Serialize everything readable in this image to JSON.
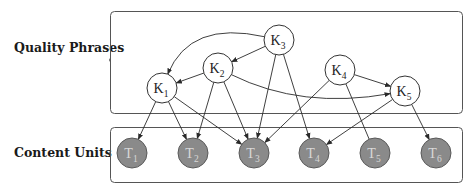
{
  "groups": {
    "quality_phrases": {
      "label": "Quality Phrases"
    },
    "content_units": {
      "label": "Content Units"
    }
  },
  "colors": {
    "edge": "#2a2a2a",
    "box_border": "#555555",
    "phrase_fill": "#ffffff",
    "unit_fill": "#8a8a8a",
    "unit_text": "#d8d8d8"
  },
  "phrases": [
    {
      "id": "K1",
      "base": "K",
      "sub": "1",
      "x": 162,
      "y": 88
    },
    {
      "id": "K2",
      "base": "K",
      "sub": "2",
      "x": 218,
      "y": 68
    },
    {
      "id": "K3",
      "base": "K",
      "sub": "3",
      "x": 279,
      "y": 40
    },
    {
      "id": "K4",
      "base": "K",
      "sub": "4",
      "x": 340,
      "y": 70
    },
    {
      "id": "K5",
      "base": "K",
      "sub": "5",
      "x": 405,
      "y": 91
    }
  ],
  "units": [
    {
      "id": "T1",
      "base": "T",
      "sub": "1",
      "x": 132,
      "y": 153
    },
    {
      "id": "T2",
      "base": "T",
      "sub": "2",
      "x": 193,
      "y": 153
    },
    {
      "id": "T3",
      "base": "T",
      "sub": "3",
      "x": 254,
      "y": 153
    },
    {
      "id": "T4",
      "base": "T",
      "sub": "4",
      "x": 314,
      "y": 153
    },
    {
      "id": "T5",
      "base": "T",
      "sub": "5",
      "x": 375,
      "y": 153
    },
    {
      "id": "T6",
      "base": "T",
      "sub": "6",
      "x": 436,
      "y": 153
    }
  ],
  "edges": [
    {
      "from": "K3",
      "to": "K1",
      "curved": true
    },
    {
      "from": "K3",
      "to": "K2"
    },
    {
      "from": "K2",
      "to": "K1"
    },
    {
      "from": "K2",
      "to": "K5",
      "curved": true
    },
    {
      "from": "K4",
      "to": "K5"
    },
    {
      "from": "K1",
      "to": "T1"
    },
    {
      "from": "K1",
      "to": "T2"
    },
    {
      "from": "K1",
      "to": "T3"
    },
    {
      "from": "K2",
      "to": "T2"
    },
    {
      "from": "K2",
      "to": "T3"
    },
    {
      "from": "K3",
      "to": "T3"
    },
    {
      "from": "K3",
      "to": "T4"
    },
    {
      "from": "K4",
      "to": "T3"
    },
    {
      "from": "K4",
      "to": "T5",
      "arrow": false
    },
    {
      "from": "K5",
      "to": "T4"
    },
    {
      "from": "K5",
      "to": "T6"
    }
  ]
}
